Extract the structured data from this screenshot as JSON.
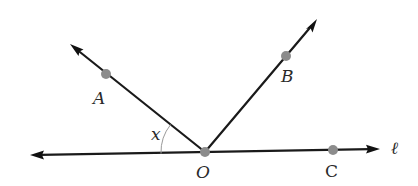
{
  "diagram": {
    "type": "geometry-angles",
    "vertex": {
      "label": "O",
      "x": 205,
      "y": 152
    },
    "line": {
      "label": "ℓ",
      "left_end": {
        "x": 30,
        "y": 155
      },
      "right_end": {
        "x": 380,
        "y": 149
      }
    },
    "rays": [
      {
        "name": "OA",
        "end": {
          "x": 70,
          "y": 44
        }
      },
      {
        "name": "OB",
        "end": {
          "x": 317,
          "y": 19
        }
      }
    ],
    "points": [
      {
        "label": "A",
        "x": 106,
        "y": 74,
        "label_x": 93,
        "label_y": 104
      },
      {
        "label": "B",
        "x": 286,
        "y": 56,
        "label_x": 281,
        "label_y": 82
      },
      {
        "label": "C",
        "x": 333,
        "y": 150,
        "label_x": 325,
        "label_y": 177
      },
      {
        "label": "O",
        "x": 205,
        "y": 152,
        "label_x": 196,
        "label_y": 178
      }
    ],
    "angle_label": {
      "text": "x",
      "x": 151,
      "y": 140
    },
    "line_label": {
      "text": "ℓ",
      "x": 391,
      "y": 154
    },
    "colors": {
      "line": "#1a1a1a",
      "point": "#8c8c8c",
      "arc": "#9a9a9a",
      "text": "#2a2a2a"
    }
  }
}
